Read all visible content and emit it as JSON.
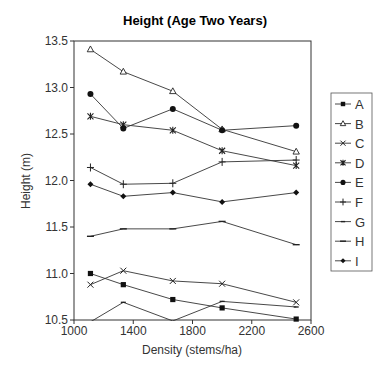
{
  "chart_data": {
    "type": "line",
    "title": "Height (Age Two Years)",
    "xlabel": "Density (stems/ha)",
    "ylabel": "Height (m)",
    "xlim": [
      1000,
      2600
    ],
    "ylim": [
      10.5,
      13.5
    ],
    "xticks": [
      1000,
      1400,
      1800,
      2200,
      2600
    ],
    "xtick_labels": [
      "1000",
      "1400",
      "1800",
      "2200",
      "2600"
    ],
    "yticks": [
      10.5,
      11.0,
      11.5,
      12.0,
      12.5,
      13.0,
      13.5
    ],
    "ytick_labels": [
      "10.5",
      "11.0",
      "11.5",
      "12.0",
      "12.5",
      "13.0",
      "13.5"
    ],
    "grid": false,
    "legend_position": "right",
    "x": [
      1111,
      1333,
      1667,
      2000,
      2500
    ],
    "series": [
      {
        "name": "A",
        "marker": "square-filled",
        "values": [
          11.0,
          10.88,
          10.72,
          10.63,
          10.51
        ]
      },
      {
        "name": "B",
        "marker": "triangle-open",
        "values": [
          13.41,
          13.17,
          12.96,
          12.55,
          12.31
        ]
      },
      {
        "name": "C",
        "marker": "x",
        "values": [
          10.88,
          11.03,
          10.92,
          10.89,
          10.69
        ]
      },
      {
        "name": "D",
        "marker": "asterisk",
        "values": [
          12.69,
          12.6,
          12.54,
          12.32,
          12.16
        ]
      },
      {
        "name": "E",
        "marker": "circle-filled",
        "values": [
          12.93,
          12.56,
          12.77,
          12.54,
          12.59
        ]
      },
      {
        "name": "F",
        "marker": "plus",
        "values": [
          12.14,
          11.96,
          11.97,
          12.2,
          12.22
        ]
      },
      {
        "name": "G",
        "marker": "dash-small",
        "values": [
          10.48,
          10.69,
          10.49,
          10.7,
          10.64
        ]
      },
      {
        "name": "H",
        "marker": "dash",
        "values": [
          11.4,
          11.48,
          11.48,
          11.56,
          11.31
        ]
      },
      {
        "name": "I",
        "marker": "diamond-filled",
        "values": [
          11.96,
          11.83,
          11.87,
          11.77,
          11.87
        ]
      }
    ]
  },
  "legend": {
    "items": [
      "A",
      "B",
      "C",
      "D",
      "E",
      "F",
      "G",
      "H",
      "I"
    ]
  }
}
